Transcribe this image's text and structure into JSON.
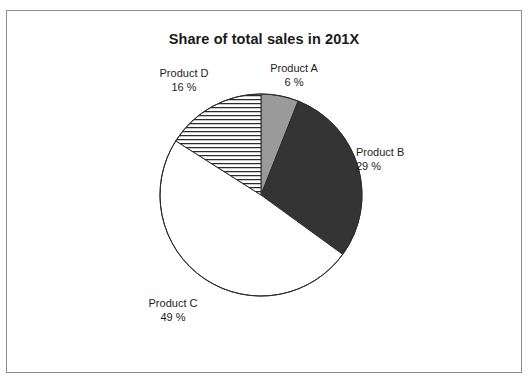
{
  "figure": {
    "title": "Share of total sales in 201X",
    "border_color": "#8d8d8d",
    "background": "#ffffff"
  },
  "chart_data": {
    "type": "pie",
    "title": "Share of total sales in 201X",
    "xlabel": "",
    "ylabel": "",
    "unit": "%",
    "total": 100,
    "start_angle_deg": 0,
    "direction": "clockwise",
    "legend": "none",
    "labels_position": "outside",
    "categories": [
      "Product A",
      "Product B",
      "Product C",
      "Product D"
    ],
    "values": [
      6,
      29,
      49,
      16
    ],
    "slices": [
      {
        "name": "Product A",
        "label": "Product A",
        "value": 6,
        "value_text": "6 %",
        "fill": "#9a9a9a",
        "pattern": "solid",
        "start_deg": 0,
        "end_deg": 21.6
      },
      {
        "name": "Product B",
        "label": "Product B",
        "value": 29,
        "value_text": "29 %",
        "fill": "#343434",
        "pattern": "solid",
        "start_deg": 21.6,
        "end_deg": 126.0
      },
      {
        "name": "Product C",
        "label": "Product C",
        "value": 49,
        "value_text": "49 %",
        "fill": "#ffffff",
        "pattern": "solid",
        "start_deg": 126.0,
        "end_deg": 302.4
      },
      {
        "name": "Product D",
        "label": "Product D",
        "value": 16,
        "value_text": "16 %",
        "fill": "#ffffff",
        "pattern": "horizontal-lines",
        "start_deg": 302.4,
        "end_deg": 360.0
      }
    ]
  }
}
